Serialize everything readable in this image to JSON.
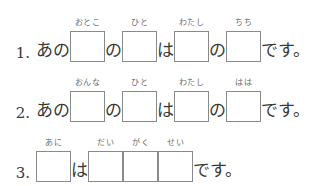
{
  "page": {
    "background_color": "#ffffff",
    "text_color": "#3a3a3a",
    "box_border_color": "#8a8a8a",
    "furigana_color": "#6d6d6d"
  },
  "exercises": [
    {
      "number": "1.",
      "segments": [
        {
          "kind": "text",
          "text": "あの"
        },
        {
          "kind": "box",
          "furigana": "おとこ"
        },
        {
          "kind": "text",
          "text": "の"
        },
        {
          "kind": "box",
          "furigana": "ひと"
        },
        {
          "kind": "text",
          "text": "は"
        },
        {
          "kind": "box",
          "furigana": "わたし"
        },
        {
          "kind": "text",
          "text": "の"
        },
        {
          "kind": "box",
          "furigana": "ちち"
        },
        {
          "kind": "text",
          "text": "です。"
        }
      ]
    },
    {
      "number": "2.",
      "segments": [
        {
          "kind": "text",
          "text": "あの"
        },
        {
          "kind": "box",
          "furigana": "おんな"
        },
        {
          "kind": "text",
          "text": "の"
        },
        {
          "kind": "box",
          "furigana": "ひと"
        },
        {
          "kind": "text",
          "text": "は"
        },
        {
          "kind": "box",
          "furigana": "わたし"
        },
        {
          "kind": "text",
          "text": "の"
        },
        {
          "kind": "box",
          "furigana": "はは"
        },
        {
          "kind": "text",
          "text": "です。"
        }
      ]
    },
    {
      "number": "3.",
      "segments": [
        {
          "kind": "box",
          "furigana": "あに"
        },
        {
          "kind": "text",
          "text": "は"
        },
        {
          "kind": "box",
          "furigana": "だい"
        },
        {
          "kind": "box",
          "furigana": "がく"
        },
        {
          "kind": "box",
          "furigana": "せい"
        },
        {
          "kind": "text",
          "text": "です。"
        }
      ]
    }
  ]
}
